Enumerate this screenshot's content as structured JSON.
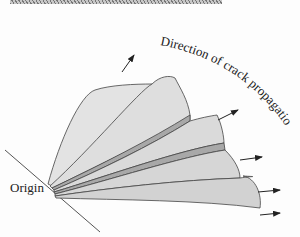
{
  "diagram": {
    "labels": {
      "origin": "Origin",
      "direction": "Direction of crack propagation"
    },
    "colors": {
      "fan_fill": "#d6d6d6",
      "ridge_fill": "#a8a8a8",
      "stroke": "#444444",
      "text": "#222222"
    },
    "elements": {
      "fan_segments": 5,
      "arrows": 5
    }
  }
}
